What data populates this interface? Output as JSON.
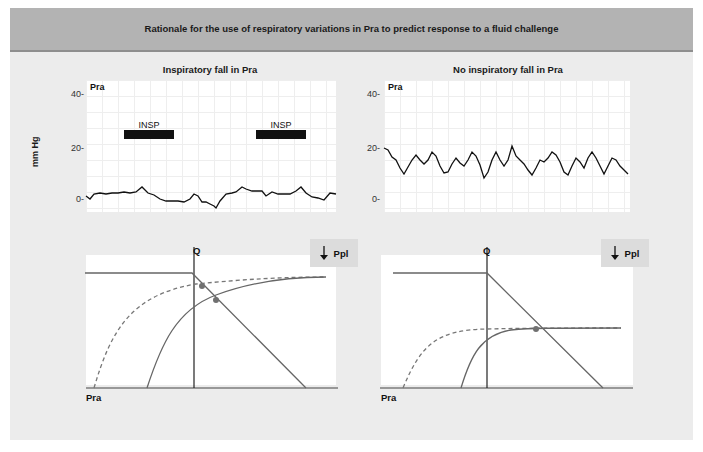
{
  "header": {
    "title": "Rationale for the use of respiratory variations in Pra to predict response to a fluid challenge"
  },
  "left": {
    "title": "Inspiratory fall in Pra",
    "trace": {
      "corner_label": "Pra",
      "ylabel": "mm Hg",
      "yticks": [
        "40-",
        "20-",
        "0-"
      ],
      "insp_labels": [
        "INSP",
        "INSP"
      ]
    },
    "diagram": {
      "q_label": "Q",
      "x_label": "Pra",
      "ppl_label": "Ppl",
      "ppl_icon": "down-arrow-icon"
    }
  },
  "right": {
    "title": "No inspiratory fall in Pra",
    "trace": {
      "corner_label": "Pra",
      "yticks": [
        "40-",
        "20-",
        "0-"
      ]
    },
    "diagram": {
      "q_label": "Q",
      "x_label": "Pra",
      "ppl_label": "Ppl",
      "ppl_icon": "down-arrow-icon"
    }
  },
  "colors": {
    "header_bg": "#b3b3b3",
    "panel_bg": "#ececec",
    "curve": "#666666",
    "dot": "#707070",
    "trace": "#111111"
  }
}
